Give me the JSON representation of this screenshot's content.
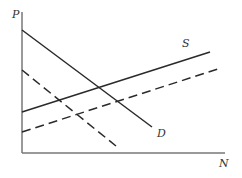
{
  "diagram": {
    "type": "supply-demand",
    "axes": {
      "y_label": "P",
      "x_label": "N",
      "color": "#555555"
    },
    "curves": [
      {
        "id": "demand",
        "label": "D",
        "style": "solid",
        "x1": 22,
        "y1": 30,
        "x2": 152,
        "y2": 127
      },
      {
        "id": "demand-shifted",
        "label": "",
        "style": "dashed",
        "x1": 22,
        "y1": 70,
        "x2": 116,
        "y2": 146
      },
      {
        "id": "supply",
        "label": "S",
        "style": "solid",
        "x1": 22,
        "y1": 112,
        "x2": 210,
        "y2": 52
      },
      {
        "id": "supply-shifted",
        "label": "",
        "style": "dashed",
        "x1": 22,
        "y1": 132,
        "x2": 218,
        "y2": 69
      }
    ],
    "labels": {
      "supply": "S",
      "demand": "D"
    },
    "line_color": "#2a2a2a"
  }
}
